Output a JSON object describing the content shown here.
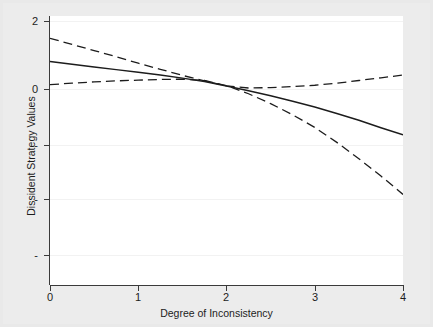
{
  "chart_data": {
    "type": "line",
    "title": "",
    "xlabel": "Degree of Inconsistency",
    "ylabel": "Dissident Strategy Values",
    "xlim": [
      0,
      4
    ],
    "ylim": [
      -4.0,
      2.0
    ],
    "grid": true,
    "legend": "none",
    "x_ticks": [
      "0",
      "1",
      "2",
      "3",
      "4"
    ],
    "x_tick_values": [
      0,
      1,
      2,
      3,
      4
    ],
    "y_ticks": [
      "2",
      "0",
      "-",
      "-",
      "-"
    ],
    "y_tick_values": [
      2,
      0,
      -1.65,
      -3.25,
      -4.9
    ],
    "x": [
      0,
      0.25,
      0.5,
      0.75,
      1,
      1.25,
      1.5,
      1.75,
      2,
      2.25,
      2.5,
      2.75,
      3,
      3.25,
      3.5,
      3.75,
      4
    ],
    "series": [
      {
        "name": "Predicted value",
        "style": "solid",
        "color": "#1c1c1c",
        "values": [
          0.81,
          0.73,
          0.65,
          0.57,
          0.49,
          0.41,
          0.32,
          0.22,
          0.09,
          -0.05,
          -0.2,
          -0.36,
          -0.53,
          -0.72,
          -0.92,
          -1.14,
          -1.35
        ]
      },
      {
        "name": "Upper 95% confidence bound",
        "style": "dashed",
        "color": "#1c1c1c",
        "values": [
          1.49,
          1.31,
          1.13,
          0.95,
          0.76,
          0.58,
          0.4,
          0.24,
          0.09,
          0.03,
          0.04,
          0.07,
          0.11,
          0.17,
          0.25,
          0.33,
          0.41
        ]
      },
      {
        "name": "Lower 95% confidence bound",
        "style": "dashed",
        "color": "#1c1c1c",
        "values": [
          0.13,
          0.17,
          0.21,
          0.24,
          0.26,
          0.28,
          0.29,
          0.25,
          0.1,
          -0.14,
          -0.43,
          -0.76,
          -1.13,
          -1.57,
          -2.05,
          -2.56,
          -3.1
        ]
      }
    ],
    "colors": {
      "background": "#e9e9e9",
      "plot_background": "#ffffff",
      "axis": "#3a3a3a",
      "gridline": "#f2f2f2",
      "line": "#1c1c1c"
    }
  }
}
